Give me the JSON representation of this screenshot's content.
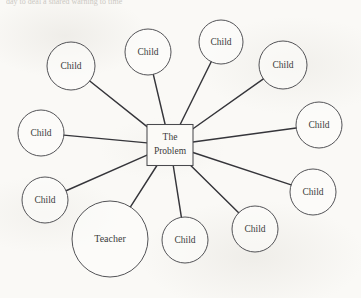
{
  "header": {
    "cropped_line": "day to deal a shared warning to time"
  },
  "diagram": {
    "type": "radial-web",
    "center": {
      "label_line1": "The",
      "label_line2": "Problem",
      "shape": "rectangle",
      "x": 170,
      "y": 145,
      "width": 46,
      "height": 41
    },
    "stroke_color": "#35353a",
    "node_fill": "#fdfdfb",
    "background": "#faf9f6",
    "nodes": [
      {
        "label": "Child",
        "x": 71,
        "y": 66,
        "r": 24,
        "size": "small"
      },
      {
        "label": "Child",
        "x": 148,
        "y": 52,
        "r": 23,
        "size": "small"
      },
      {
        "label": "Child",
        "x": 221,
        "y": 42,
        "r": 22,
        "size": "small"
      },
      {
        "label": "Child",
        "x": 283,
        "y": 65,
        "r": 24,
        "size": "small"
      },
      {
        "label": "Child",
        "x": 319,
        "y": 125,
        "r": 23,
        "size": "small"
      },
      {
        "label": "Child",
        "x": 313,
        "y": 192,
        "r": 23,
        "size": "small"
      },
      {
        "label": "Child",
        "x": 255,
        "y": 229,
        "r": 23,
        "size": "small"
      },
      {
        "label": "Child",
        "x": 185,
        "y": 240,
        "r": 23,
        "size": "small"
      },
      {
        "label": "Teacher",
        "x": 110,
        "y": 239,
        "r": 38,
        "size": "large"
      },
      {
        "label": "Child",
        "x": 45,
        "y": 200,
        "r": 23,
        "size": "small"
      },
      {
        "label": "Child",
        "x": 41,
        "y": 133,
        "r": 23,
        "size": "small"
      }
    ]
  }
}
